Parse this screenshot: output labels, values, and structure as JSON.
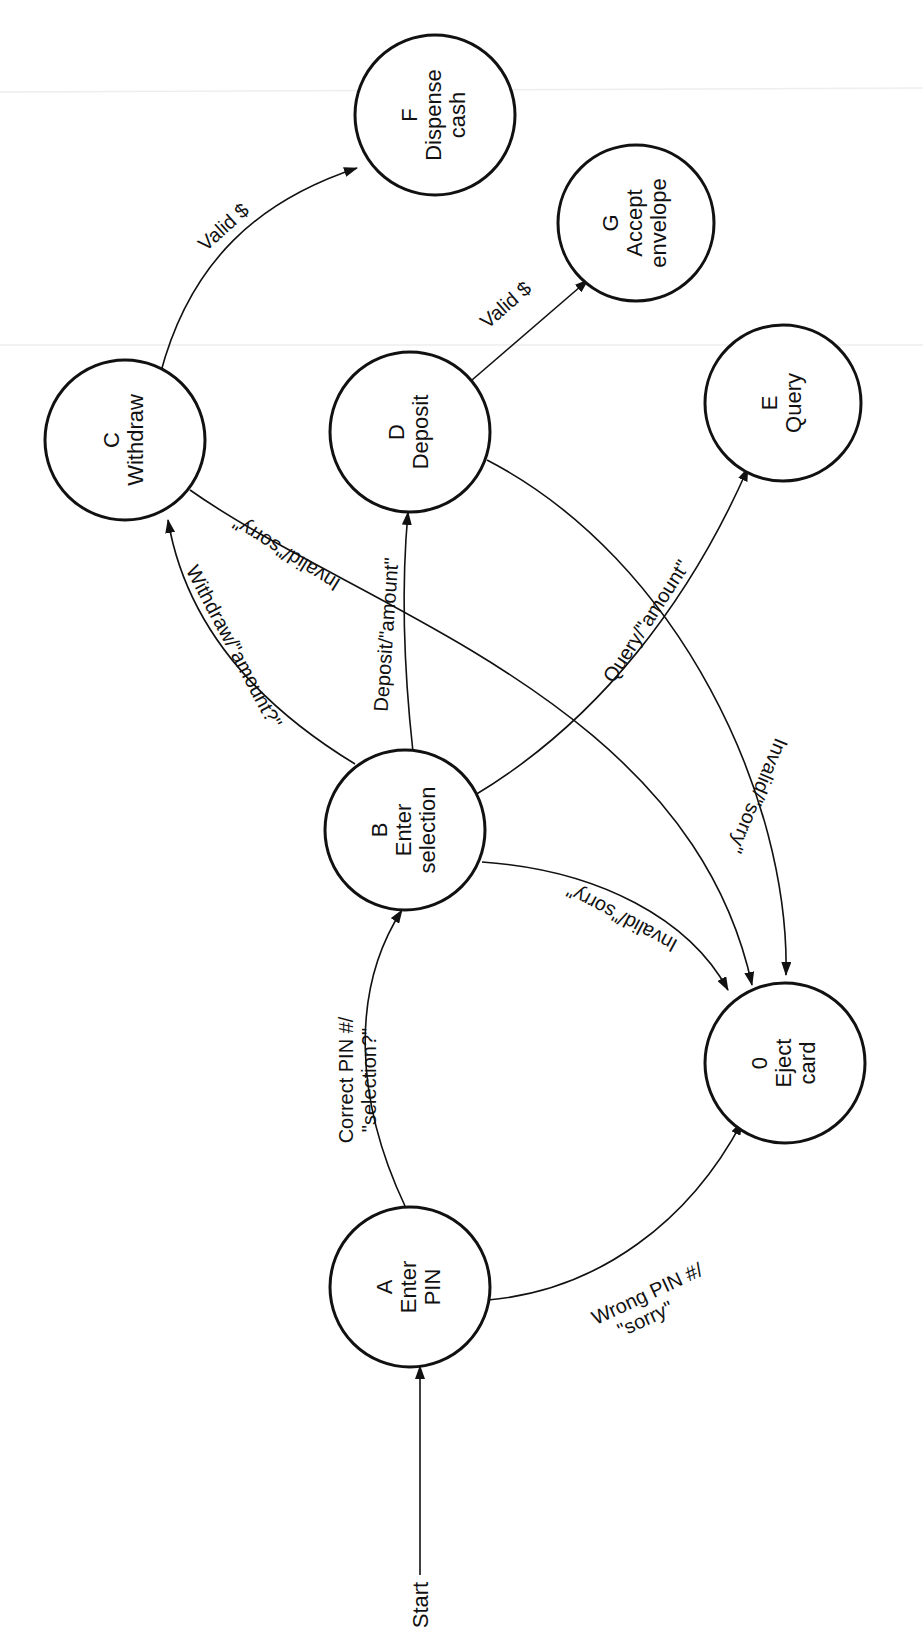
{
  "diagram": {
    "type": "state-transition-diagram",
    "orientation": "rotated-90-ccw",
    "stroke_color": "#111111",
    "background": "#ffffff",
    "start_label": "Start",
    "nodes": [
      {
        "id": "A",
        "line1": "A",
        "line2": "Enter",
        "line3": "PIN"
      },
      {
        "id": "B",
        "line1": "B",
        "line2": "Enter",
        "line3": "selection"
      },
      {
        "id": "C",
        "line1": "C",
        "line2": "Withdraw",
        "line3": ""
      },
      {
        "id": "D",
        "line1": "D",
        "line2": "Deposit",
        "line3": ""
      },
      {
        "id": "E",
        "line1": "E",
        "line2": "Query",
        "line3": ""
      },
      {
        "id": "F",
        "line1": "F",
        "line2": "Dispense",
        "line3": "cash"
      },
      {
        "id": "G",
        "line1": "G",
        "line2": "Accept",
        "line3": "envelope"
      },
      {
        "id": "0",
        "line1": "0",
        "line2": "Eject",
        "line3": "card"
      }
    ],
    "edges": [
      {
        "from": "Start",
        "to": "A",
        "label1": "",
        "label2": ""
      },
      {
        "from": "A",
        "to": "B",
        "label1": "Correct PIN #/",
        "label2": "\"selection?\""
      },
      {
        "from": "A",
        "to": "0",
        "label1": "Wrong PIN #/",
        "label2": "\"sorry\""
      },
      {
        "from": "B",
        "to": "C",
        "label1": "Withdraw/\"amount?\"",
        "label2": ""
      },
      {
        "from": "B",
        "to": "D",
        "label1": "Deposit/\"amount\"",
        "label2": ""
      },
      {
        "from": "B",
        "to": "E",
        "label1": "Query/\"amount\"",
        "label2": ""
      },
      {
        "from": "B",
        "to": "0",
        "label1": "Invalid/\"sorry\"",
        "label2": ""
      },
      {
        "from": "C",
        "to": "F",
        "label1": "Valid $",
        "label2": ""
      },
      {
        "from": "C",
        "to": "0",
        "label1": "Invalid/\"sorry\"",
        "label2": ""
      },
      {
        "from": "D",
        "to": "G",
        "label1": "Valid $",
        "label2": ""
      },
      {
        "from": "D",
        "to": "0",
        "label1": "Invalid/\"sorry\"",
        "label2": ""
      }
    ]
  }
}
